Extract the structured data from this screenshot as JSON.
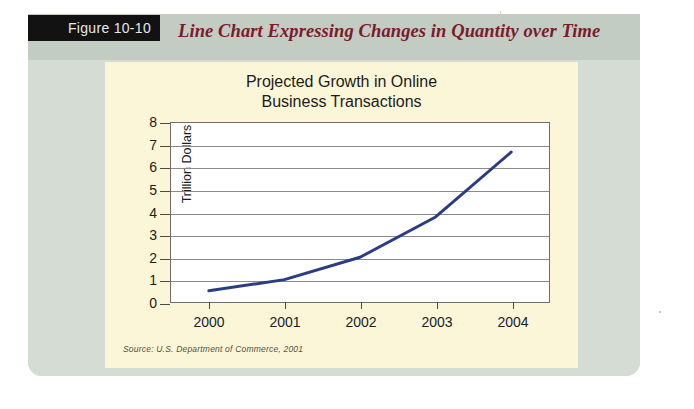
{
  "figure": {
    "tab_label": "Figure 10-10",
    "caption": "Line Chart Expressing Changes in Quantity over Time",
    "caption_color": "#7b1b2c",
    "tab_bg": "#121212",
    "panel_color": "#d4dcd4",
    "card_color": "#fbf6d8"
  },
  "chart_data": {
    "type": "line",
    "title": "Projected Growth in Online Business Transactions",
    "title_line1": "Projected Growth in Online",
    "title_line2": "Business Transactions",
    "categories": [
      "2000",
      "2001",
      "2002",
      "2003",
      "2004"
    ],
    "x": [
      2000,
      2001,
      2002,
      2003,
      2004
    ],
    "values": [
      0.5,
      1.0,
      2.0,
      3.8,
      6.7
    ],
    "series": [
      {
        "name": "Online business transactions",
        "values": [
          0.5,
          1.0,
          2.0,
          3.8,
          6.7
        ],
        "color": "#2b3c80"
      }
    ],
    "xlabel": "",
    "ylabel": "Trillion Dollars",
    "ylim": [
      0,
      8
    ],
    "yticks": [
      0,
      1,
      2,
      3,
      4,
      5,
      6,
      7,
      8
    ],
    "ytick_labels": [
      "0",
      "1",
      "2",
      "3",
      "4",
      "5",
      "6",
      "7",
      "8"
    ],
    "grid": true,
    "grid_axis": "y",
    "legend": false,
    "legend_position": "none",
    "line_color": "#2b3c80",
    "line_width": 3,
    "markers": false,
    "plot_bg": "#ffffff",
    "source": "Source: U.S. Department of Commerce, 2001"
  }
}
